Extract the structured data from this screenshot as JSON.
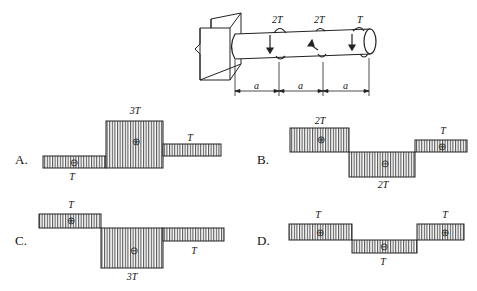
{
  "figure": {
    "shaft": {
      "torques": [
        {
          "label": "2T",
          "position": 1
        },
        {
          "label": "2T",
          "position": 2
        },
        {
          "label": "T",
          "position": 3
        }
      ],
      "dimensions": [
        "a",
        "a",
        "a"
      ]
    },
    "options": [
      {
        "letter": "A.",
        "segments": [
          {
            "value": "T",
            "sign": "-",
            "sign_glyph": "⊖"
          },
          {
            "value": "3T",
            "sign": "+",
            "sign_glyph": "⊕"
          },
          {
            "value": "T",
            "sign": "+",
            "sign_glyph": ""
          }
        ]
      },
      {
        "letter": "B.",
        "segments": [
          {
            "value": "2T",
            "sign": "+",
            "sign_glyph": "⊕"
          },
          {
            "value": "2T",
            "sign": "-",
            "sign_glyph": "⊖"
          },
          {
            "value": "T",
            "sign": "+",
            "sign_glyph": "⊕"
          }
        ]
      },
      {
        "letter": "C.",
        "segments": [
          {
            "value": "T",
            "sign": "+",
            "sign_glyph": "⊕"
          },
          {
            "value": "3T",
            "sign": "-",
            "sign_glyph": "⊖"
          },
          {
            "value": "T",
            "sign": "-",
            "sign_glyph": ""
          }
        ]
      },
      {
        "letter": "D.",
        "segments": [
          {
            "value": "T",
            "sign": "+",
            "sign_glyph": "⊕"
          },
          {
            "value": "T",
            "sign": "-",
            "sign_glyph": "⊖"
          },
          {
            "value": "T",
            "sign": "+",
            "sign_glyph": "⊕"
          }
        ]
      }
    ]
  }
}
